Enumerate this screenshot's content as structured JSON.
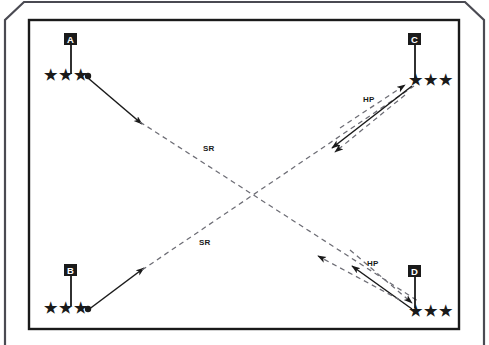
{
  "diagram": {
    "background_color": "#ffffff",
    "line_color": "#1a1a1a",
    "outer_frame": {
      "name": "outer-chamfered-frame",
      "chamfered_corners": [
        "top-left",
        "top-right"
      ]
    },
    "inner_frame": {
      "name": "inner-rectangle-frame"
    },
    "positions": [
      {
        "id": "A",
        "label": "A",
        "corner": "top-left",
        "stars": 3,
        "has_dot": true,
        "flag_x": 71,
        "flag_y": 41,
        "stars_x": 44,
        "stars_y": 76
      },
      {
        "id": "C",
        "label": "C",
        "corner": "top-right",
        "stars": 3,
        "has_dot": false,
        "flag_x": 415,
        "flag_y": 41,
        "stars_x": 411,
        "stars_y": 80
      },
      {
        "id": "B",
        "label": "B",
        "corner": "bottom-left",
        "stars": 3,
        "has_dot": true,
        "flag_x": 71,
        "flag_y": 272,
        "stars_x": 44,
        "stars_y": 308
      },
      {
        "id": "D",
        "label": "D",
        "corner": "bottom-right",
        "stars": 3,
        "has_dot": false,
        "flag_x": 415,
        "flag_y": 273,
        "stars_x": 411,
        "stars_y": 311
      }
    ],
    "route_labels": [
      {
        "id": "sr-upper",
        "text": "SR",
        "x": 203,
        "y": 151,
        "route": "A to D",
        "style": "dashed"
      },
      {
        "id": "sr-lower",
        "text": "SR",
        "x": 199,
        "y": 245,
        "route": "B to C",
        "style": "dashed"
      },
      {
        "id": "hp-upper",
        "text": "HP",
        "x": 370,
        "y": 102,
        "route": "near C",
        "style": "mixed"
      },
      {
        "id": "hp-lower",
        "text": "HP",
        "x": 373,
        "y": 266,
        "route": "near D",
        "style": "mixed"
      }
    ],
    "routes": [
      {
        "id": "route-a-to-d",
        "from": "A",
        "to": "D",
        "solid_segment": "A to midpoint arrowhead",
        "dashed_segment": "continues to D",
        "label": "SR"
      },
      {
        "id": "route-b-to-c",
        "from": "B",
        "to": "C",
        "solid_segment": "B to midpoint arrowhead",
        "dashed_segment": "continues to C",
        "label": "SR"
      },
      {
        "id": "route-hp-c",
        "near": "C",
        "label": "HP",
        "description": "dashed up-right arrow plus solid down-left arrow and dashed down-left arrow"
      },
      {
        "id": "route-hp-d",
        "near": "D",
        "label": "HP",
        "description": "dashed down-right arrow plus solid up-left arrow and dashed up-left arrow"
      }
    ],
    "glyphs": {
      "star": "★",
      "dot": "●"
    }
  }
}
